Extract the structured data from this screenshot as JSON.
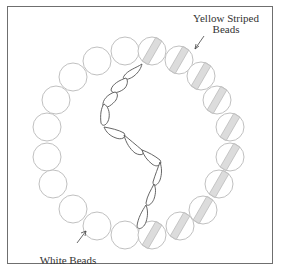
{
  "figure": {
    "labels": {
      "yellow_line1": "Yellow Striped",
      "yellow_line2": "Beads",
      "white": "White Beads"
    },
    "colors": {
      "bead_stroke": "#b9b9b9",
      "stripe_fill": "#dcdcdc",
      "chain_stroke": "#555555",
      "frame": "#6f6f6f"
    },
    "white_beads": [
      [
        125,
        51
      ],
      [
        97,
        61
      ],
      [
        73,
        77
      ],
      [
        56,
        100
      ],
      [
        47,
        127
      ],
      [
        47,
        157
      ],
      [
        53,
        184
      ],
      [
        73,
        209
      ],
      [
        97,
        226
      ],
      [
        125,
        235
      ]
    ],
    "striped_beads": [
      [
        152,
        51
      ],
      [
        179,
        60
      ],
      [
        201,
        76
      ],
      [
        217,
        100
      ],
      [
        230,
        127
      ],
      [
        230,
        157
      ],
      [
        219,
        184
      ],
      [
        203,
        210
      ],
      [
        180,
        226
      ],
      [
        152,
        235
      ]
    ],
    "bead_radius": 14
  }
}
